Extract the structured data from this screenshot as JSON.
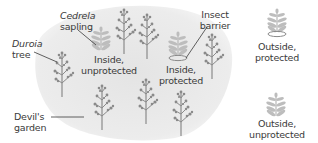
{
  "diagram": {
    "colors": {
      "garden_fill": "#e8e8e8",
      "tree": "#8a8a8a",
      "sapling": "#b8b8b8",
      "text": "#3a3a3a",
      "leader_line": "#3a3a3a"
    },
    "labels": {
      "cedrela_line1": "Cedrela",
      "cedrela_line2": "sapling",
      "duroia_line1": "Duroia",
      "duroia_line2": "tree",
      "inside_unprotected_line1": "Inside,",
      "inside_unprotected_line2": "unprotected",
      "insect_barrier_line1": "Insect",
      "insect_barrier_line2": "barrier",
      "inside_protected_line1": "Inside,",
      "inside_protected_line2": "protected",
      "outside_protected_line1": "Outside,",
      "outside_protected_line2": "protected",
      "devils_garden_line1": "Devil's",
      "devils_garden_line2": "garden",
      "outside_unprotected_line1": "Outside,",
      "outside_unprotected_line2": "unprotected"
    },
    "icons": {
      "tree": "duroia-tree-icon",
      "sapling": "cedrela-sapling-icon",
      "barrier": "insect-barrier-ring-icon"
    }
  }
}
